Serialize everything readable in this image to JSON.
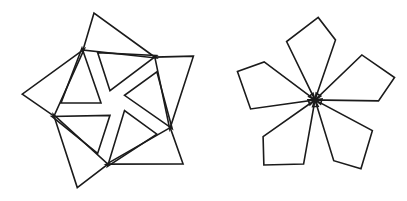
{
  "canvas": {
    "width": 407,
    "height": 201,
    "background": "#ffffff",
    "stroke_color": "#1b1b1b",
    "stroke_width": 1.6
  },
  "figures": [
    {
      "name": "triangle-pinwheel",
      "description": "five large and five small outlined triangles rotated in 72-degree steps",
      "center": [
        114,
        103
      ],
      "copies": 5,
      "step_deg": 72,
      "shapes": [
        {
          "name": "large-triangle",
          "points": [
            [
              94,
              13
            ],
            [
              83,
              50
            ],
            [
              156,
              58
            ]
          ]
        },
        {
          "name": "small-triangle",
          "points": [
            [
              82,
              48
            ],
            [
              61,
              103
            ],
            [
              101,
              103
            ]
          ]
        }
      ]
    },
    {
      "name": "pentagon-flower",
      "description": "five outlined kite-pentagon petals rotated in 72-degree steps around a small central knot",
      "center": [
        315,
        100
      ],
      "copies": 5,
      "step_deg": 72,
      "shapes": [
        {
          "name": "petal",
          "points": [
            [
              312.7,
              106.6
            ],
            [
              335.5,
              39.9
            ],
            [
              318.2,
              17.4
            ],
            [
              286.6,
              41.5
            ],
            [
              318.1,
              106.3
            ]
          ]
        }
      ],
      "center_dot": {
        "cx": 315.4,
        "cy": 100.3,
        "r": 2.1
      }
    }
  ]
}
